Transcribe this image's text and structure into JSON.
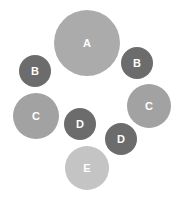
{
  "diagram": {
    "type": "bubble-cluster",
    "nodes": [
      {
        "id": "a",
        "label": "A",
        "cx": 87,
        "cy": 43,
        "r": 33,
        "color": "#ababab"
      },
      {
        "id": "b1",
        "label": "B",
        "cx": 35,
        "cy": 71,
        "r": 16,
        "color": "#6c6c6c"
      },
      {
        "id": "b2",
        "label": "B",
        "cx": 137,
        "cy": 63,
        "r": 16,
        "color": "#6c6c6c"
      },
      {
        "id": "c1",
        "label": "C",
        "cx": 36,
        "cy": 116,
        "r": 23,
        "color": "#a2a2a2"
      },
      {
        "id": "c2",
        "label": "C",
        "cx": 149,
        "cy": 106,
        "r": 22,
        "color": "#a2a2a2"
      },
      {
        "id": "d1",
        "label": "D",
        "cx": 80,
        "cy": 124,
        "r": 16,
        "color": "#6c6c6c"
      },
      {
        "id": "d2",
        "label": "D",
        "cx": 121,
        "cy": 139,
        "r": 16,
        "color": "#6c6c6c"
      },
      {
        "id": "e",
        "label": "E",
        "cx": 87,
        "cy": 168,
        "r": 22,
        "color": "#c4c4c4"
      }
    ]
  }
}
